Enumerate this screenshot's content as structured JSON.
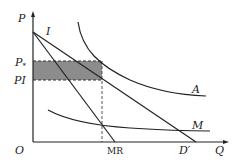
{
  "diagram": {
    "type": "economics-monopoly-price-regulation",
    "axes": {
      "y_label": "P",
      "x_label": "Q",
      "origin_label": "O"
    },
    "price_labels": {
      "p_star": "P",
      "p_star_subscript": "*",
      "p1": "PI"
    },
    "curve_labels": {
      "demand_intercept": "I",
      "average_cost": "A",
      "marginal_cost": "M",
      "marginal_revenue": "MR",
      "demand": "D′"
    },
    "colors": {
      "line": "#222222",
      "shaded_region": "#8c8c8c",
      "background": "#ffffff"
    }
  }
}
